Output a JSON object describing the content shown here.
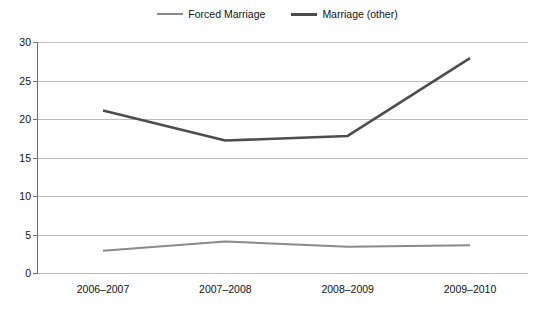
{
  "chart_data": {
    "type": "line",
    "title": "",
    "subtitle": "",
    "xlabel": "",
    "ylabel": "",
    "categories": [
      "2006–2007",
      "2007–2008",
      "2008–2009",
      "2009–2010"
    ],
    "series": [
      {
        "name": "Forced Marriage",
        "color": "#8a8a8a",
        "values": [
          2.9,
          4.1,
          3.4,
          3.6
        ]
      },
      {
        "name": "Marriage (other)",
        "color": "#4d4d4d",
        "values": [
          21.1,
          17.2,
          17.8,
          27.9
        ]
      }
    ],
    "ylim": [
      0,
      30
    ],
    "yticks": [
      0,
      5,
      10,
      15,
      20,
      25,
      30
    ],
    "ytick_labels": [
      "0",
      "5",
      "10",
      "15",
      "20",
      "25",
      "30"
    ],
    "grid": true,
    "grid_axis": "y",
    "legend": true,
    "legend_position": "top-center",
    "legend_entries": [
      "Forced Marriage",
      "Marriage (other)"
    ],
    "annotations": []
  },
  "colors": {
    "background": "#ffffff",
    "gridline": "#bcbcbc",
    "axis": "#6e6e6e",
    "text": "#111111",
    "series_forced_marriage": "#8a8a8a",
    "series_marriage_other": "#4d4d4d"
  }
}
